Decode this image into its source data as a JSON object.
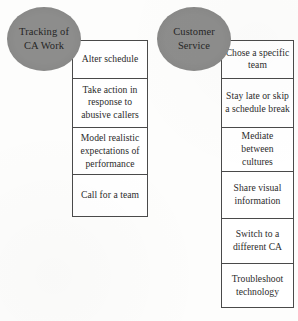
{
  "diagram": {
    "type": "two-branch list diagram",
    "branches": [
      {
        "id": "tracking",
        "node_label": "Tracking of CA Work",
        "node_shape": "ellipse",
        "node_fill": "#8d8d8c",
        "items": [
          "Alter schedule",
          "Take action in response to abusive callers",
          "Model realistic expectations of performance",
          "Call for a team"
        ]
      },
      {
        "id": "service",
        "node_label": "Customer Service",
        "node_shape": "ellipse",
        "node_fill": "#8d8d8c",
        "items": [
          "Chose a specific team",
          "Stay late or skip a schedule break",
          "Mediate between cultures",
          "Share visual information",
          "Switch to a different CA",
          "Troubleshoot technology"
        ]
      }
    ],
    "colors": {
      "node_fill": "#8d8d8c",
      "border": "#4a4a4a",
      "text": "#2b2b2b",
      "background": "#fdfdfc"
    }
  }
}
